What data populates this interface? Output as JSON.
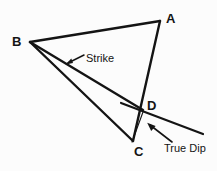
{
  "figure": {
    "background_color": "#fcfcfc",
    "line_color": "#141414",
    "text_color": "#141414",
    "width": 217,
    "height": 171
  },
  "vertices": [
    {
      "id": "A",
      "label": "A",
      "x": 160,
      "y": 21
    },
    {
      "id": "B",
      "label": "B",
      "x": 30,
      "y": 42
    },
    {
      "id": "C",
      "label": "C",
      "x": 133,
      "y": 141
    },
    {
      "id": "D",
      "label": "D",
      "x": 143,
      "y": 110
    }
  ],
  "edges": [
    {
      "name": "A-B",
      "from": "A",
      "to": "B"
    },
    {
      "name": "A-C",
      "from": "A",
      "to": "C"
    },
    {
      "name": "B-C",
      "from": "B",
      "to": "C"
    },
    {
      "name": "B-D",
      "from": "B",
      "to": "D"
    }
  ],
  "annotations": [
    {
      "id": "strike",
      "label": "Strike",
      "kind": "leader-arrow",
      "points_to_edge": "B-D",
      "arrow_tail_x": 84,
      "arrow_tail_y": 55,
      "arrow_head_x": 66,
      "arrow_head_y": 64
    },
    {
      "id": "true-dip",
      "label": "True Dip",
      "kind": "leader-arrow",
      "points_to_line": "dip-direction-line",
      "arrow_tail_x": 170,
      "arrow_tail_y": 141,
      "arrow_head_x": 147,
      "arrow_head_y": 123
    }
  ],
  "lines": [
    {
      "id": "strike-line",
      "name": "strike-line",
      "x1": 121,
      "y1": 103,
      "x2": 203,
      "y2": 134,
      "description": "strike line extending beyond D to the lower right"
    },
    {
      "id": "dip-direction-line",
      "name": "dip-direction-line",
      "x1": 143,
      "y1": 112,
      "x2": 132,
      "y2": 142,
      "description": "thin true-dip direction tick from D down toward C"
    }
  ]
}
